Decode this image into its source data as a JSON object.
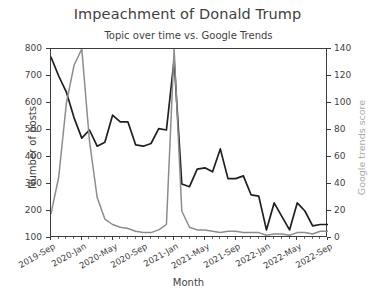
{
  "chart_data": {
    "type": "line",
    "title": "Impeachment of Donald Trump",
    "subtitle": "Topic over time vs. Google Trends",
    "xlabel": "Month",
    "ylabel": "Number of posts",
    "ylabel_right": "Google trends score",
    "grid": false,
    "legend": "none",
    "ylim": [
      100,
      800
    ],
    "ylim_right": [
      0,
      140
    ],
    "yticks": [
      800,
      700,
      600,
      500,
      400,
      300,
      200,
      100
    ],
    "yticks_right": [
      140,
      120,
      100,
      80,
      60,
      40,
      20,
      0
    ],
    "xtick_labels": [
      "2019-Sep",
      "2020-Jan",
      "2020-May",
      "2020-Sep",
      "2021-Jan",
      "2021-May",
      "2021-Sep",
      "2022-Jan",
      "2022-May",
      "2022-Sep"
    ],
    "x": [
      "2019-Sep",
      "2019-Oct",
      "2019-Nov",
      "2019-Dec",
      "2020-Jan",
      "2020-Feb",
      "2020-Mar",
      "2020-Apr",
      "2020-May",
      "2020-Jun",
      "2020-Jul",
      "2020-Aug",
      "2020-Sep",
      "2020-Oct",
      "2020-Nov",
      "2020-Dec",
      "2021-Jan",
      "2021-Feb",
      "2021-Mar",
      "2021-Apr",
      "2021-May",
      "2021-Jun",
      "2021-Jul",
      "2021-Aug",
      "2021-Sep",
      "2021-Oct",
      "2021-Nov",
      "2021-Dec",
      "2022-Jan",
      "2022-Feb",
      "2022-Mar",
      "2022-Apr",
      "2022-May",
      "2022-Jun",
      "2022-Jul",
      "2022-Aug",
      "2022-Sep"
    ],
    "series": [
      {
        "name": "Number of posts",
        "axis": "left",
        "color": "#1f1f1f",
        "values": [
          770,
          700,
          640,
          545,
          470,
          500,
          440,
          455,
          555,
          530,
          530,
          445,
          440,
          450,
          505,
          500,
          760,
          300,
          290,
          355,
          360,
          345,
          430,
          320,
          320,
          330,
          260,
          255,
          130,
          230,
          180,
          130,
          230,
          200,
          145,
          150,
          150
        ]
      },
      {
        "name": "Google trends score",
        "axis": "right",
        "color": "#8c8c8c",
        "values": [
          18,
          45,
          100,
          128,
          140,
          72,
          30,
          14,
          10,
          8,
          7,
          5,
          4,
          4,
          6,
          10,
          140,
          20,
          8,
          6,
          6,
          5,
          4,
          5,
          5,
          4,
          4,
          4,
          2,
          3,
          3,
          2,
          4,
          4,
          3,
          5,
          5
        ]
      }
    ]
  }
}
